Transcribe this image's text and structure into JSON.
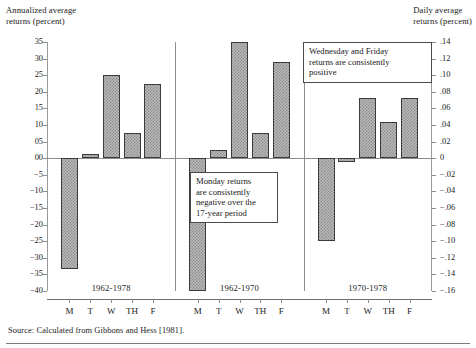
{
  "figure": {
    "left_axis_title": "Annualized average\nreturns (percent)",
    "right_axis_title": "Daily average\nreturns (percent)",
    "source": "Source: Calculated from Gibbons and Hess [1981].",
    "callouts": [
      {
        "name": "monday",
        "text": "Monday returns\nare consistently\nnegative over the\n17-year period"
      },
      {
        "name": "wednesday-friday",
        "text": "Wednesday and Friday\nreturns are consistently\npositive"
      }
    ]
  },
  "chart_data": {
    "type": "bar",
    "title": "",
    "subtitle": "",
    "xlabel": "",
    "ylabel": "Annualized average returns (percent)",
    "ylabel_right": "Daily average returns (percent)",
    "grid": false,
    "legend": "none",
    "ylim": [
      -40,
      35
    ],
    "yticks": [
      35,
      30,
      25,
      20,
      15,
      10,
      5,
      0,
      -5,
      -10,
      -15,
      -20,
      -25,
      -30,
      -35,
      -40
    ],
    "ytick_labels": [
      "35",
      "30",
      "25",
      "20",
      "15",
      "10",
      "05",
      "00",
      "−5",
      "−10",
      "−15",
      "−20",
      "−25",
      "−30",
      "−35",
      "−40"
    ],
    "ylim_right": [
      -0.16,
      0.14
    ],
    "yticks_right": [
      0.14,
      0.12,
      0.1,
      0.08,
      0.06,
      0.04,
      0.02,
      0,
      -0.02,
      -0.04,
      -0.06,
      -0.08,
      -0.1,
      -0.12,
      -0.14,
      -0.16
    ],
    "ytick_labels_right": [
      ".14",
      ".12",
      ".10",
      ".08",
      ".06",
      ".04",
      ".02",
      "0",
      "−.02",
      "−.04",
      "−.06",
      "−.08",
      "−.10",
      "−.12",
      "−.14",
      "−.16"
    ],
    "categories": [
      "M",
      "T",
      "W",
      "TH",
      "F"
    ],
    "panels": [
      {
        "label": "1962-1978",
        "values": [
          -33.5,
          1.2,
          25.0,
          7.5,
          22.2
        ]
      },
      {
        "label": "1962-1970",
        "values": [
          -40.0,
          2.5,
          35.0,
          7.5,
          29.0
        ]
      },
      {
        "label": "1970-1978",
        "values": [
          -25.0,
          -1.0,
          18.0,
          11.0,
          18.0
        ]
      }
    ]
  }
}
